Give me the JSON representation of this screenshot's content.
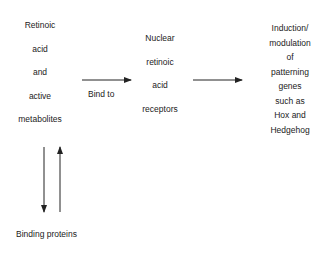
{
  "nodes": {
    "source": {
      "lines": [
        "Retinoic",
        "acid",
        "and",
        "active",
        "metabolites"
      ]
    },
    "receptor": {
      "lines": [
        "Nuclear",
        "retinoic",
        "acid",
        "receptors"
      ]
    },
    "outcome": {
      "lines": [
        "Induction/",
        "modulation",
        "of",
        "patterning",
        "genes",
        "such as",
        "Hox and",
        "Hedgehog"
      ]
    },
    "binding": {
      "label": "Binding proteins"
    }
  },
  "edges": {
    "bind_to": {
      "label": "Bind to"
    }
  }
}
